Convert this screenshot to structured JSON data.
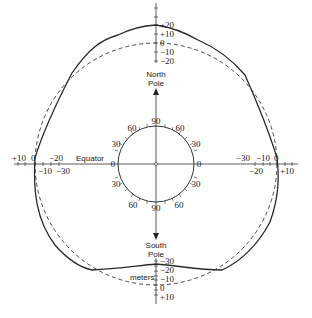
{
  "figure": {
    "colors": {
      "line": "#2a2a2a",
      "background": "#ffffff"
    }
  },
  "labels": {
    "north_pole_1": "North",
    "north_pole_2": "Pole",
    "south_pole_1": "South",
    "south_pole_2": "Pole",
    "equator": "Equator",
    "units": "meters"
  },
  "top_scale": [
    "+20",
    "+10",
    "0",
    "−10",
    "−20"
  ],
  "bottom_scale": [
    "−30",
    "−20",
    "−10",
    "0",
    "+10"
  ],
  "left_scale": {
    "top": [
      "+10",
      "0",
      "−20"
    ],
    "bottom": [
      "−10",
      "−30"
    ]
  },
  "right_scale": {
    "top": [
      "−30",
      "−10",
      "0"
    ],
    "bottom": [
      "−20",
      "+10"
    ]
  },
  "latitude_circle": {
    "top_left": [
      "0",
      "30",
      "60"
    ],
    "top_center": "90",
    "top_right": [
      "60",
      "30",
      "0"
    ],
    "bottom_left": [
      "30",
      "60"
    ],
    "bottom_center": "90",
    "bottom_right": [
      "30",
      "60"
    ]
  }
}
